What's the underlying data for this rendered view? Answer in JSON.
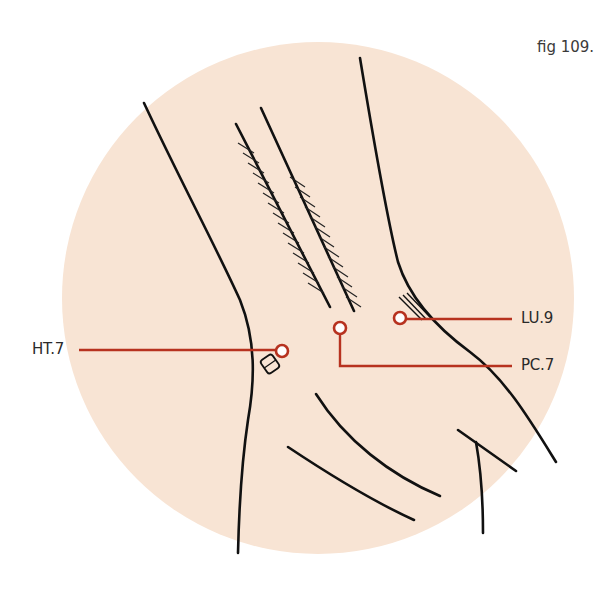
{
  "figure": {
    "caption": "fig 109.",
    "background_color": "#f8e4d4",
    "line_color": "#111111",
    "marker_color": "#b7321f"
  },
  "points": [
    {
      "id": "HT.7",
      "label": "HT.7",
      "side": "left"
    },
    {
      "id": "PC.7",
      "label": "PC.7",
      "side": "right"
    },
    {
      "id": "LU.9",
      "label": "LU.9",
      "side": "right"
    }
  ]
}
